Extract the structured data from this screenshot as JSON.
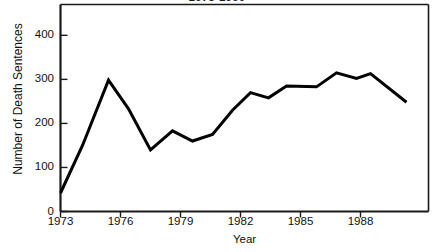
{
  "chart_data": {
    "type": "line",
    "title": "1973-1990",
    "xlabel": "Year",
    "ylabel": "Number of Death Sentences",
    "x": [
      1973,
      1974,
      1975,
      1976,
      1977,
      1978,
      1979,
      1980,
      1981,
      1982,
      1983,
      1984,
      1985,
      1986,
      1987,
      1988,
      1989,
      1990
    ],
    "values": [
      42,
      150,
      298,
      233,
      140,
      183,
      160,
      175,
      230,
      270,
      258,
      285,
      283,
      315,
      302,
      313,
      248,
      248
    ],
    "categories": [
      "1973",
      "1974",
      "1975",
      "1976",
      "1977",
      "1978",
      "1979",
      "1980",
      "1981",
      "1982",
      "1983",
      "1984",
      "1985",
      "1986",
      "1987",
      "1988",
      "1989",
      "1990"
    ],
    "series": [
      {
        "name": "Number of Death Sentences",
        "points": [
          {
            "x": 1973,
            "y": 42
          },
          {
            "x": 1974.1,
            "y": 150
          },
          {
            "x": 1975.4,
            "y": 298
          },
          {
            "x": 1976.4,
            "y": 233
          },
          {
            "x": 1977.5,
            "y": 140
          },
          {
            "x": 1978.6,
            "y": 183
          },
          {
            "x": 1979.6,
            "y": 160
          },
          {
            "x": 1980.6,
            "y": 175
          },
          {
            "x": 1981.6,
            "y": 230
          },
          {
            "x": 1982.5,
            "y": 270
          },
          {
            "x": 1983.4,
            "y": 258
          },
          {
            "x": 1984.3,
            "y": 285
          },
          {
            "x": 1985.8,
            "y": 283
          },
          {
            "x": 1986.8,
            "y": 315
          },
          {
            "x": 1987.8,
            "y": 302
          },
          {
            "x": 1988.5,
            "y": 313
          },
          {
            "x": 1990.3,
            "y": 248
          }
        ]
      }
    ],
    "xlim": [
      1973,
      1991.4
    ],
    "ylim": [
      0,
      470
    ],
    "xticks": [
      1973,
      1976,
      1979,
      1982,
      1985,
      1988
    ],
    "xtick_labels": [
      "1973",
      "1976",
      "1979",
      "1982",
      "1985",
      "1988"
    ],
    "yticks": [
      0,
      100,
      200,
      300,
      400
    ],
    "ytick_labels": [
      "0",
      "100",
      "200",
      "300",
      "400"
    ],
    "grid": false,
    "legend": false,
    "line_color": "#000000",
    "line_width": 3,
    "axis_color": "#1a1a1a",
    "background": "#ffffff"
  }
}
